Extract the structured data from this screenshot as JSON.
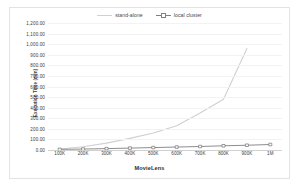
{
  "chart_data": {
    "type": "line",
    "title": "",
    "xlabel": "MovieLens",
    "ylabel": "Execution Time (min)",
    "categories": [
      "100K",
      "200K",
      "300K",
      "400K",
      "500K",
      "600K",
      "700K",
      "800K",
      "900K",
      "1M"
    ],
    "ylim": [
      0,
      1200
    ],
    "ytick_step": 100,
    "ytick_labels": [
      "1,200.00",
      "1,100.00",
      "1,000.00",
      "900.00",
      "800.00",
      "700.00",
      "600.00",
      "500.00",
      "400.00",
      "300.00",
      "200.00",
      "100.00",
      "0.00"
    ],
    "ytick_values": [
      1200,
      1100,
      1000,
      900,
      800,
      700,
      600,
      500,
      400,
      300,
      200,
      100,
      0
    ],
    "grid": true,
    "legend_position": "top-center",
    "series": [
      {
        "name": "stand-alone",
        "color": "#d0d0d0",
        "marker": "none",
        "values": [
          10,
          30,
          65,
          110,
          160,
          230,
          350,
          480,
          960,
          null
        ]
      },
      {
        "name": "local cluster",
        "color": "#808080",
        "marker": "square",
        "values": [
          6,
          9,
          13,
          18,
          23,
          28,
          33,
          40,
          45,
          52
        ]
      }
    ]
  },
  "legend": {
    "items": [
      {
        "label": "stand-alone"
      },
      {
        "label": "local cluster"
      }
    ]
  },
  "axes": {
    "y_title": "Execution Time (min)",
    "x_title": "MovieLens"
  }
}
